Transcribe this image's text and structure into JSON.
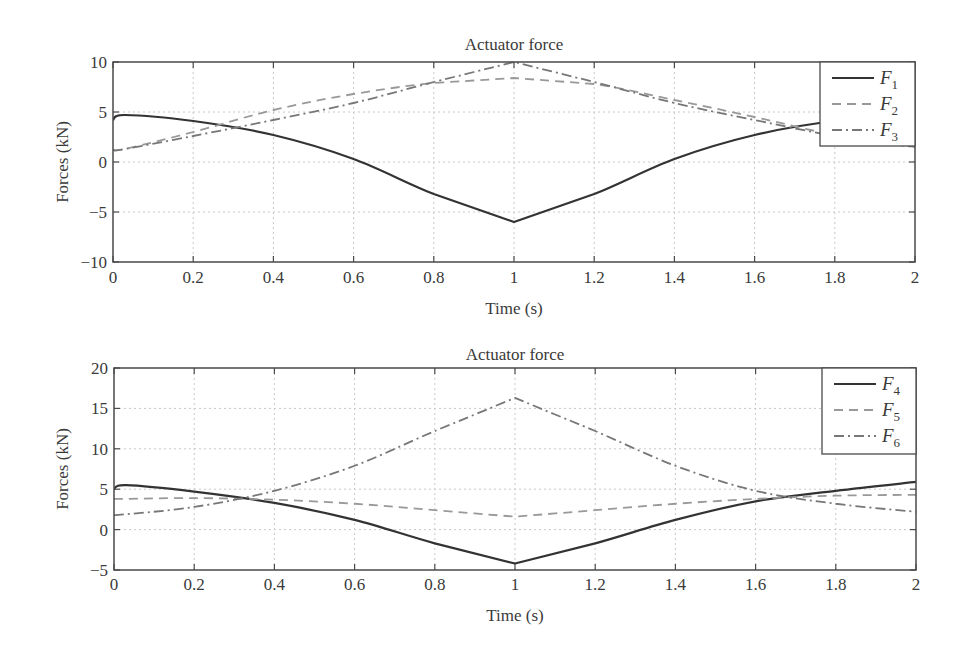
{
  "chart_data": [
    {
      "type": "line",
      "title": "Actuator force",
      "xlabel": "Time (s)",
      "ylabel": "Forces (kN)",
      "xlim": [
        0,
        2
      ],
      "ylim": [
        -10,
        10
      ],
      "xticks": [
        0,
        0.2,
        0.4,
        0.6,
        0.8,
        1,
        1.2,
        1.4,
        1.6,
        1.8,
        2
      ],
      "xtick_labels": [
        "0",
        "0.2",
        "0.4",
        "0.6",
        "0.8",
        "1",
        "1.2",
        "1.4",
        "1.6",
        "1.8",
        "2"
      ],
      "yticks": [
        -10,
        -5,
        0,
        5,
        10
      ],
      "ytick_labels": [
        "−10",
        "−5",
        "0",
        "5",
        "10"
      ],
      "grid": true,
      "legend_position": "upper right",
      "x": [
        0,
        0.03,
        0.2,
        0.4,
        0.6,
        0.8,
        1.0,
        1.2,
        1.4,
        1.6,
        1.8,
        2.0
      ],
      "series": [
        {
          "name": "F1",
          "base": "F",
          "sub": "1",
          "style": "solid",
          "color": "#333333",
          "values": [
            4.2,
            4.7,
            4.1,
            2.7,
            0.3,
            -3.2,
            -6.0,
            -3.2,
            0.3,
            2.7,
            4.1,
            4.6
          ]
        },
        {
          "name": "F2",
          "base": "F",
          "sub": "2",
          "style": "dashed",
          "color": "#999999",
          "values": [
            1.2,
            1.3,
            3.0,
            5.2,
            6.8,
            7.9,
            8.4,
            7.8,
            6.2,
            4.5,
            2.7,
            1.5
          ]
        },
        {
          "name": "F3",
          "base": "F",
          "sub": "3",
          "style": "dashdot",
          "color": "#777777",
          "values": [
            1.2,
            1.3,
            2.6,
            4.2,
            5.9,
            8.0,
            10.0,
            8.0,
            5.9,
            4.2,
            2.6,
            1.5
          ]
        }
      ]
    },
    {
      "type": "line",
      "title": "Actuator force",
      "xlabel": "Time (s)",
      "ylabel": "Forces (kN)",
      "xlim": [
        0,
        2
      ],
      "ylim": [
        -5,
        20
      ],
      "xticks": [
        0,
        0.2,
        0.4,
        0.6,
        0.8,
        1,
        1.2,
        1.4,
        1.6,
        1.8,
        2
      ],
      "xtick_labels": [
        "0",
        "0.2",
        "0.4",
        "0.6",
        "0.8",
        "1",
        "1.2",
        "1.4",
        "1.6",
        "1.8",
        "2"
      ],
      "yticks": [
        -5,
        0,
        5,
        10,
        15,
        20
      ],
      "ytick_labels": [
        "−5",
        "0",
        "5",
        "10",
        "15",
        "20"
      ],
      "grid": true,
      "legend_position": "upper right",
      "x": [
        0,
        0.03,
        0.2,
        0.4,
        0.6,
        0.8,
        1.0,
        1.2,
        1.4,
        1.6,
        1.8,
        2.0
      ],
      "series": [
        {
          "name": "F4",
          "base": "F",
          "sub": "4",
          "style": "solid",
          "color": "#333333",
          "values": [
            5.0,
            5.5,
            4.7,
            3.3,
            1.2,
            -1.7,
            -4.2,
            -1.7,
            1.2,
            3.5,
            4.8,
            5.9
          ]
        },
        {
          "name": "F5",
          "base": "F",
          "sub": "5",
          "style": "dashed",
          "color": "#999999",
          "values": [
            3.8,
            3.8,
            3.9,
            3.7,
            3.2,
            2.4,
            1.6,
            2.4,
            3.2,
            3.8,
            4.2,
            4.3
          ]
        },
        {
          "name": "F6",
          "base": "F",
          "sub": "6",
          "style": "dashdot",
          "color": "#777777",
          "values": [
            1.8,
            1.9,
            2.8,
            4.8,
            7.9,
            12.2,
            16.3,
            12.2,
            7.9,
            4.8,
            3.2,
            2.2
          ]
        }
      ]
    }
  ],
  "layout": {
    "panels": [
      {
        "left": 113,
        "top": 62,
        "right": 915,
        "bottom": 262,
        "title_y": 44,
        "xtick_y": 283,
        "xlabel_y": 314,
        "ylabel_x": 68,
        "legend": {
          "x": 820,
          "y": 62,
          "w": 95,
          "h": 84
        }
      },
      {
        "left": 114,
        "top": 368,
        "right": 916,
        "bottom": 570,
        "title_y": 354,
        "xtick_y": 590,
        "xlabel_y": 621,
        "ylabel_x": 68,
        "legend": {
          "x": 822,
          "y": 368,
          "w": 94,
          "h": 86
        }
      }
    ]
  }
}
